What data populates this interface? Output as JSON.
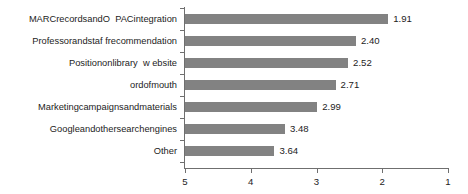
{
  "chart_data": {
    "type": "bar",
    "orientation": "horizontal",
    "title": "",
    "subtitle": "",
    "xlabel": "",
    "ylabel": "",
    "grid": false,
    "legend": false,
    "axis_reversed": true,
    "xlim": [
      5,
      1
    ],
    "xticks": [
      "5",
      "4",
      "3",
      "2",
      "1"
    ],
    "xtick_values": [
      5,
      4,
      3,
      2,
      1
    ],
    "categories": [
      "MARCrecordsandO  PACintegration",
      "Professorandstaf frecommendation",
      "Positiononlibrary  w ebsite",
      "ordofmouth",
      "Marketingcampaignsandmaterials",
      "Googleandothersearchengines",
      "Other"
    ],
    "values": [
      1.91,
      2.4,
      2.52,
      2.71,
      2.99,
      3.48,
      3.64
    ],
    "value_labels": [
      "1.91",
      "2.40",
      "2.52",
      "2.71",
      "2.99",
      "3.48",
      "3.64"
    ],
    "bar_color": "#828282",
    "axis_color": "#6f6f6f",
    "background": "#ffffff"
  }
}
